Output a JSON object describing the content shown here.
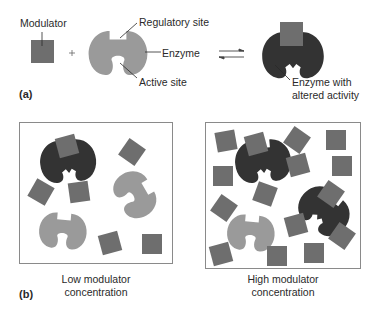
{
  "part_a": {
    "label": "(a)",
    "modulator_label": "Modulator",
    "plus": "+",
    "regulatory_site_label": "Regulatory site",
    "enzyme_label": "Enzyme",
    "active_site_label": "Active site",
    "altered_label_line1": "Enzyme with",
    "altered_label_line2": "altered activity"
  },
  "part_b": {
    "label": "(b)",
    "low_caption_line1": "Low modulator",
    "low_caption_line2": "concentration",
    "high_caption_line1": "High modulator",
    "high_caption_line2": "concentration"
  },
  "colors": {
    "modulator": "#6e6e6e",
    "enzyme_inactive": "#9a9a9a",
    "enzyme_bound": "#333333",
    "panel_border": "#8a8a8a",
    "text": "#2a2a2a"
  }
}
